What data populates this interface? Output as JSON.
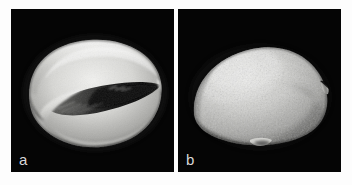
{
  "figure": {
    "background_color": "#fdfdfd",
    "panel_background_color": "#050505",
    "label_color": "#d8d8d8",
    "panels": [
      {
        "id": "panel-a",
        "label": "a",
        "view": "ventral view with aperture",
        "subject": "shell-specimen-ventral",
        "imaging": "scanning electron micrograph",
        "specimen_tone_light": "#e8e8e6",
        "specimen_tone_mid": "#9a9a98",
        "specimen_tone_dark": "#141414"
      },
      {
        "id": "panel-b",
        "label": "b",
        "view": "dorsal view, granular surface",
        "subject": "shell-specimen-dorsal",
        "imaging": "scanning electron micrograph",
        "specimen_tone_light": "#dedede",
        "specimen_tone_mid": "#a9a9a7",
        "specimen_tone_dark": "#3a3a3a"
      }
    ]
  }
}
